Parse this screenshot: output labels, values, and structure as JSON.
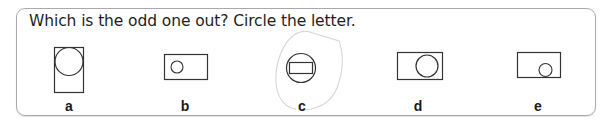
{
  "question": {
    "text": "Which is the odd one out? Circle the letter."
  },
  "options": [
    {
      "letter": "a",
      "description": "tall rectangle with large circle at top",
      "center_x": 69
    },
    {
      "letter": "b",
      "description": "wide rectangle with small circle at left",
      "center_x": 185
    },
    {
      "letter": "c",
      "description": "circle with rectangle inside",
      "center_x": 302,
      "circled": true
    },
    {
      "letter": "d",
      "description": "wide rectangle with medium circle at right",
      "center_x": 418
    },
    {
      "letter": "e",
      "description": "wide rectangle with small circle at bottom right",
      "center_x": 538
    }
  ],
  "answer_mark": {
    "type": "hand-drawn-circle",
    "around": "c",
    "color": "#d4d4d4"
  },
  "colors": {
    "stroke": "#333333",
    "frame_border": "#a9a9a9",
    "text": "#1e1e1e"
  }
}
